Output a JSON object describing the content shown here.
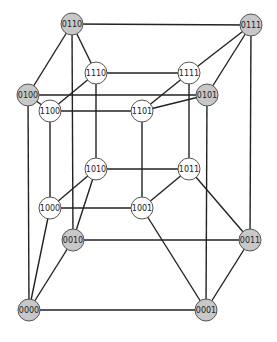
{
  "diagram": {
    "colors": {
      "outer_cube_fill": "#c8c8c8",
      "inner_cube_fill": "#ffffff",
      "stroke": "#222222"
    },
    "nodes": [
      {
        "id": "0110",
        "label": "0110",
        "x": 72,
        "y": 24,
        "group": "outer"
      },
      {
        "id": "0111",
        "label": "0111",
        "x": 251,
        "y": 25,
        "group": "outer"
      },
      {
        "id": "1110",
        "label": "1110",
        "x": 96,
        "y": 73,
        "group": "inner"
      },
      {
        "id": "1111",
        "label": "1111",
        "x": 189,
        "y": 73,
        "group": "inner"
      },
      {
        "id": "0100",
        "label": "0100",
        "x": 28,
        "y": 95,
        "group": "outer"
      },
      {
        "id": "0101",
        "label": "0101",
        "x": 207,
        "y": 95,
        "group": "outer"
      },
      {
        "id": "1100",
        "label": "1100",
        "x": 50,
        "y": 111,
        "group": "inner"
      },
      {
        "id": "1101",
        "label": "1101",
        "x": 142,
        "y": 111,
        "group": "inner"
      },
      {
        "id": "1010",
        "label": "1010",
        "x": 96,
        "y": 169,
        "group": "inner"
      },
      {
        "id": "1011",
        "label": "1011",
        "x": 189,
        "y": 169,
        "group": "inner"
      },
      {
        "id": "1000",
        "label": "1000",
        "x": 50,
        "y": 208,
        "group": "inner"
      },
      {
        "id": "1001",
        "label": "1001",
        "x": 142,
        "y": 208,
        "group": "inner"
      },
      {
        "id": "0010",
        "label": "0010",
        "x": 73,
        "y": 240,
        "group": "outer"
      },
      {
        "id": "0011",
        "label": "0011",
        "x": 250,
        "y": 240,
        "group": "outer"
      },
      {
        "id": "0000",
        "label": "0000",
        "x": 29,
        "y": 310,
        "group": "outer"
      },
      {
        "id": "0001",
        "label": "0001",
        "x": 206,
        "y": 310,
        "group": "outer"
      }
    ],
    "edges": [
      [
        "0000",
        "0001"
      ],
      [
        "0000",
        "0010"
      ],
      [
        "0000",
        "0100"
      ],
      [
        "0000",
        "1000"
      ],
      [
        "0001",
        "0011"
      ],
      [
        "0001",
        "0101"
      ],
      [
        "0001",
        "1001"
      ],
      [
        "0010",
        "0011"
      ],
      [
        "0010",
        "0110"
      ],
      [
        "0010",
        "1010"
      ],
      [
        "0011",
        "0111"
      ],
      [
        "0011",
        "1011"
      ],
      [
        "0100",
        "0101"
      ],
      [
        "0100",
        "0110"
      ],
      [
        "0100",
        "1100"
      ],
      [
        "0101",
        "0111"
      ],
      [
        "0101",
        "1101"
      ],
      [
        "0110",
        "0111"
      ],
      [
        "0110",
        "1110"
      ],
      [
        "0111",
        "1111"
      ],
      [
        "1000",
        "1001"
      ],
      [
        "1000",
        "1010"
      ],
      [
        "1000",
        "1100"
      ],
      [
        "1001",
        "1011"
      ],
      [
        "1001",
        "1101"
      ],
      [
        "1010",
        "1011"
      ],
      [
        "1010",
        "1110"
      ],
      [
        "1011",
        "1111"
      ],
      [
        "1100",
        "1101"
      ],
      [
        "1100",
        "1110"
      ],
      [
        "1101",
        "1111"
      ],
      [
        "1110",
        "1111"
      ]
    ]
  }
}
